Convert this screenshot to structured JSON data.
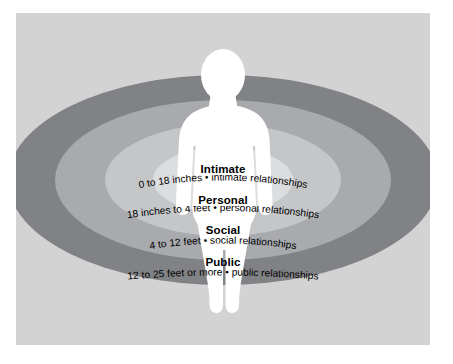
{
  "diagram": {
    "name": "Proxemic Zones",
    "panel_background_color": "#d3d3d3",
    "page_background_color": "#ffffff",
    "figure_color": "#ffffff"
  },
  "zones": [
    {
      "id": "intimate",
      "title": "Intimate",
      "distance": "0 to 18 inches",
      "separator": "•",
      "relationships": "intimate relationships",
      "description": "0 to 18 inches • intimate relationships",
      "ring_color": "#dcdddf"
    },
    {
      "id": "personal",
      "title": "Personal",
      "distance": "18 inches to 4 feet",
      "separator": "•",
      "relationships": "personal relationships",
      "description": "18 inches to 4 feet • personal relationships",
      "ring_color": "#c4c6c8"
    },
    {
      "id": "social",
      "title": "Social",
      "distance": "4 to 12 feet",
      "separator": "•",
      "relationships": "social relationships",
      "description": "4 to 12 feet • social relationships",
      "ring_color": "#a8aaad"
    },
    {
      "id": "public",
      "title": "Public",
      "distance": "12 to 25 feet or more",
      "separator": "•",
      "relationships": "public relationships",
      "description": "12 to 25 feet or more • public relationships",
      "ring_color": "#808285"
    }
  ]
}
